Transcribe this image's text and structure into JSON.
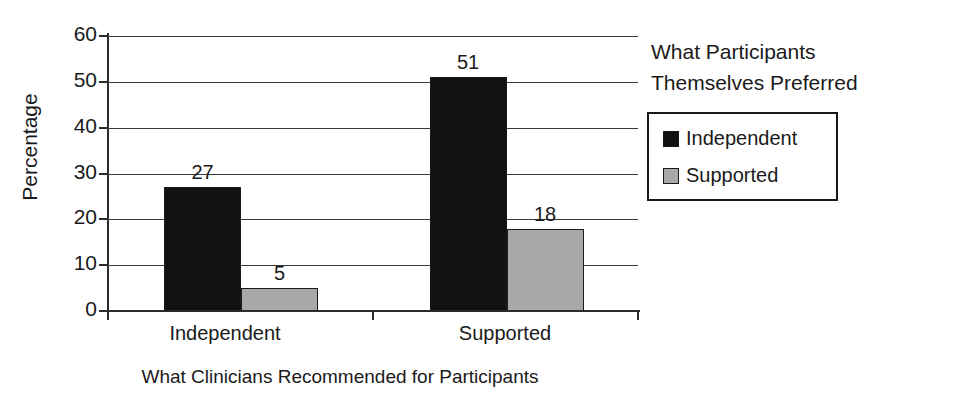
{
  "chart_data": {
    "type": "bar",
    "title": "",
    "xlabel": "What Clinicians Recommended for Participants",
    "ylabel": "Percentage",
    "categories": [
      "Independent",
      "Supported"
    ],
    "series": [
      {
        "name": "Independent",
        "values": [
          27,
          51
        ],
        "color": "#111111"
      },
      {
        "name": "Supported",
        "values": [
          5,
          18
        ],
        "color": "#a8a8a8"
      }
    ],
    "ylim": [
      0,
      60
    ],
    "yticks": [
      0,
      10,
      20,
      30,
      40,
      50,
      60
    ],
    "ytick_labels": [
      "0",
      "10",
      "20",
      "30",
      "40",
      "50",
      "60"
    ],
    "grid": true,
    "legend_position": "right",
    "legend_title": "What Participants Themselves Preferred",
    "data_labels": [
      "27",
      "5",
      "51",
      "18"
    ]
  },
  "axes": {
    "y_title": "Percentage",
    "x_title": "What Clinicians Recommended for Participants",
    "y_ticks": [
      {
        "label": "60",
        "value": 60
      },
      {
        "label": "50",
        "value": 50
      },
      {
        "label": "40",
        "value": 40
      },
      {
        "label": "30",
        "value": 30
      },
      {
        "label": "20",
        "value": 20
      },
      {
        "label": "10",
        "value": 10
      },
      {
        "label": "0",
        "value": 0
      }
    ],
    "x_categories": [
      {
        "label": "Independent"
      },
      {
        "label": "Supported"
      }
    ]
  },
  "bars": [
    {
      "group": "Independent",
      "series": "Independent",
      "value": 27,
      "label": "27"
    },
    {
      "group": "Independent",
      "series": "Supported",
      "value": 5,
      "label": "5"
    },
    {
      "group": "Supported",
      "series": "Independent",
      "value": 51,
      "label": "51"
    },
    {
      "group": "Supported",
      "series": "Supported",
      "value": 18,
      "label": "18"
    }
  ],
  "legend": {
    "title_line_1": "What Participants",
    "title_line_2": "Themselves Preferred",
    "entries": [
      {
        "label": "Independent",
        "color": "#111111"
      },
      {
        "label": "Supported",
        "color": "#a8a8a8"
      }
    ]
  }
}
